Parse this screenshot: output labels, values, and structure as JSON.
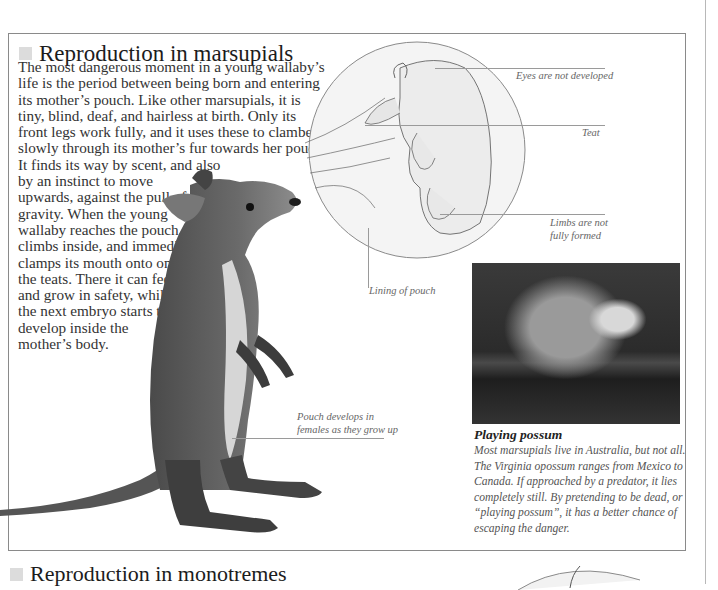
{
  "section1": {
    "title": "Reproduction in marsupials",
    "paragraph_lines": [
      "The most dangerous moment in a young wallaby’s",
      "life is the period between being born and entering",
      "its mother’s pouch. Like other marsupials, it is",
      "tiny, blind, deaf, and hairless at birth. Only its",
      "front legs work fully, and it uses these to clamber",
      "slowly through its mother’s fur towards her pouch.",
      "It finds its way by scent, and also",
      "by an instinct to move",
      "upwards, against the pull of",
      "gravity. When the young",
      "wallaby reaches the pouch, it",
      "climbs inside, and immediately",
      "clamps its mouth onto one of",
      "the teats. There it can feed",
      "and grow in safety, while",
      "the next embryo starts to",
      "develop inside the",
      "mother’s body."
    ]
  },
  "embryo_labels": {
    "eyes": "Eyes are not developed",
    "teat": "Teat",
    "limbs_line1": "Limbs are not",
    "limbs_line2": "fully formed",
    "lining": "Lining of pouch"
  },
  "wallaby_label": {
    "line1": "Pouch develops in",
    "line2": "females as they grow up"
  },
  "possum": {
    "title": "Playing possum",
    "lines": [
      "Most marsupials live in Australia, but not all.",
      "The Virginia opossum ranges from Mexico to",
      "Canada. If approached by a predator, it lies",
      "completely still. By pretending to be dead, or",
      "“playing possum”, it has a better chance of",
      "escaping the danger."
    ]
  },
  "section2": {
    "title": "Reproduction in monotremes"
  },
  "colors": {
    "frame": "#8a8a8a",
    "heading_square": "#dcdcdc",
    "label_text": "#666666"
  }
}
